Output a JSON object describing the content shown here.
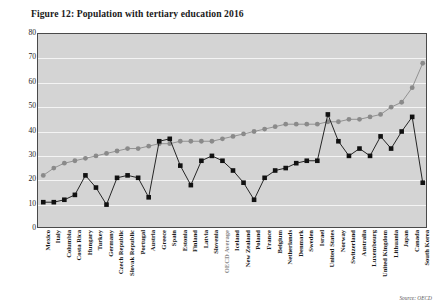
{
  "figure": {
    "title": "Figure 12: Population with tertiary education 2016",
    "source_note": "Source: OECD"
  },
  "chart_data": {
    "type": "scatter",
    "title": "Figure 12: Population with tertiary education 2016",
    "xlabel": "",
    "ylabel": "",
    "ylim": [
      0,
      80
    ],
    "ytick_step": 10,
    "yticks": [
      "0",
      "10",
      "20",
      "30",
      "40",
      "50",
      "60",
      "70",
      "80"
    ],
    "grid": true,
    "legend": "none",
    "plot_background": "#d4d4d4",
    "gridline_color": "#f4f4f4",
    "categories": [
      "Mexico",
      "Italy",
      "Columbia",
      "Costa Rica",
      "Hungary",
      "Turkey",
      "Germany",
      "Czech Republic",
      "Slovak Republic",
      "Portugal",
      "Austria",
      "Greece",
      "Spain",
      "Estonia",
      "Finland",
      "Latvia",
      "Slovenia",
      "OECD Average",
      "Iceland",
      "New Zealand",
      "Poland",
      "France",
      "Belgium",
      "Netherlands",
      "Denmark",
      "Sweden",
      "Israel",
      "United States",
      "Norway",
      "Switzerland",
      "Australia",
      "Luxembourg",
      "United Kingdom",
      "Lithuania",
      "Japan",
      "Canada",
      "South Korea"
    ],
    "highlight_category": "OECD Average",
    "highlight_label_color": "#8c8c8c",
    "series": [
      {
        "name": "Tertiary education (upper series)",
        "marker": "circle",
        "color": "#8a8a8a",
        "values": [
          22,
          25,
          27,
          28,
          29,
          30,
          31,
          32,
          33,
          33,
          34,
          35,
          35,
          36,
          36,
          36,
          36,
          37,
          38,
          39,
          40,
          41,
          42,
          43,
          43,
          43,
          43,
          44,
          44,
          45,
          45,
          46,
          47,
          50,
          52,
          58,
          68
        ]
      },
      {
        "name": "Tertiary education (lower series)",
        "marker": "square",
        "color": "#111111",
        "values": [
          11,
          11,
          12,
          14,
          22,
          17,
          10,
          21,
          22,
          21,
          13,
          36,
          37,
          26,
          18,
          28,
          30,
          28,
          24,
          19,
          12,
          21,
          24,
          25,
          27,
          28,
          28,
          47,
          36,
          30,
          33,
          30,
          38,
          33,
          40,
          46,
          19
        ]
      }
    ]
  }
}
